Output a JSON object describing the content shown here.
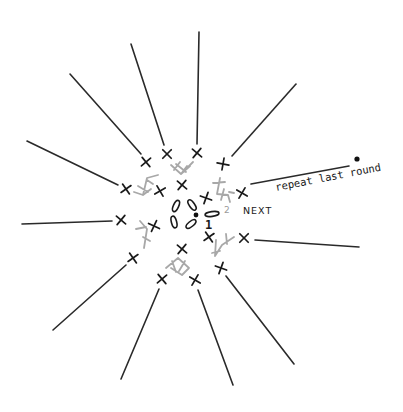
{
  "diagram": {
    "labels": {
      "round1": "1",
      "round2": "2",
      "next": "NEXT",
      "repeat": "repeat last round"
    },
    "colors": {
      "ink": "#1a1a1a",
      "previous_round": "#a8a8a8",
      "background": "#ffffff"
    },
    "center": {
      "x": 196,
      "y": 215
    },
    "chains_round1": [
      {
        "cx": 176,
        "cy": 206,
        "rx": 2.6,
        "ry": 6,
        "rot": 25
      },
      {
        "cx": 192,
        "cy": 205,
        "rx": 2.6,
        "ry": 6,
        "rot": -35
      },
      {
        "cx": 174,
        "cy": 222,
        "rx": 2.6,
        "ry": 6,
        "rot": -15
      },
      {
        "cx": 191,
        "cy": 224,
        "rx": 2.6,
        "ry": 6,
        "rot": 50
      },
      {
        "cx": 212,
        "cy": 214,
        "rx": 7,
        "ry": 2.4,
        "rot": -8
      }
    ],
    "rays": [
      {
        "x1": 118,
        "y1": 185,
        "x2": 27,
        "y2": 141
      },
      {
        "x1": 141,
        "y1": 154,
        "x2": 70,
        "y2": 74
      },
      {
        "x1": 164,
        "y1": 145,
        "x2": 131,
        "y2": 44
      },
      {
        "x1": 197,
        "y1": 144,
        "x2": 199,
        "y2": 32
      },
      {
        "x1": 232,
        "y1": 156,
        "x2": 296,
        "y2": 84
      },
      {
        "x1": 251,
        "y1": 184,
        "x2": 349,
        "y2": 166
      },
      {
        "x1": 255,
        "y1": 240,
        "x2": 359,
        "y2": 247
      },
      {
        "x1": 226,
        "y1": 276,
        "x2": 294,
        "y2": 364
      },
      {
        "x1": 198,
        "y1": 290,
        "x2": 233,
        "y2": 385
      },
      {
        "x1": 159,
        "y1": 289,
        "x2": 121,
        "y2": 379
      },
      {
        "x1": 126,
        "y1": 265,
        "x2": 53,
        "y2": 330
      },
      {
        "x1": 112,
        "y1": 221,
        "x2": 22,
        "y2": 224
      }
    ],
    "single_crochets": [
      {
        "x": 126,
        "y": 189,
        "r": 15
      },
      {
        "x": 146,
        "y": 162,
        "r": 10
      },
      {
        "x": 167,
        "y": 154,
        "r": 5
      },
      {
        "x": 197,
        "y": 153,
        "r": 0
      },
      {
        "x": 223,
        "y": 164,
        "r": -30
      },
      {
        "x": 242,
        "y": 193,
        "r": -10
      },
      {
        "x": 182,
        "y": 185,
        "r": 0
      },
      {
        "x": 160,
        "y": 191,
        "r": 20
      },
      {
        "x": 206,
        "y": 198,
        "r": -20
      },
      {
        "x": 121,
        "y": 220,
        "r": 0
      },
      {
        "x": 154,
        "y": 226,
        "r": -15
      },
      {
        "x": 133,
        "y": 258,
        "r": 15
      },
      {
        "x": 182,
        "y": 249,
        "r": 0
      },
      {
        "x": 162,
        "y": 279,
        "r": 10
      },
      {
        "x": 195,
        "y": 280,
        "r": -10
      },
      {
        "x": 209,
        "y": 237,
        "r": 15
      },
      {
        "x": 244,
        "y": 238,
        "r": 5
      },
      {
        "x": 221,
        "y": 268,
        "r": -20
      }
    ],
    "previous_round_paths": [
      "M 134 192 L 143 195 L 151 189 M 143 195 L 147 178 L 158 175 M 138 186 L 148 192 M 147 180 L 153 184",
      "M 171 165 L 181 174 L 190 166 M 181 174 L 187 166 M 176 164 L 186 172 M 174 170 L 180 162 M 185 170 L 193 162",
      "M 220 178 L 217 194 L 228 195 L 230 202 M 213 183 L 225 182 M 224 189 L 221 200 M 229 192 L 234 193",
      "M 140 221 L 147 229 L 144 248 M 136 229 L 146 227 M 143 237 L 150 241",
      "M 166 268 L 178 258 L 189 268 L 182 275 L 171 268 M 172 261 L 176 272 M 185 261 L 179 271",
      "M 216 240 L 215 256 L 222 245 L 234 237 M 212 253 L 220 251 M 226 234 L 227 244"
    ],
    "repeat_marker": {
      "x": 357,
      "y": 159
    }
  }
}
